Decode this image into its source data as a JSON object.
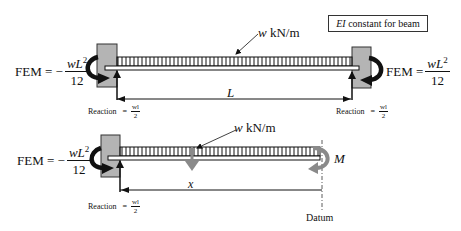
{
  "note": {
    "ei_symbol": "EI",
    "text": " constant for beam"
  },
  "top_beam": {
    "load_label_w": "w",
    "load_label_units": " kN/m",
    "span_label": "L",
    "left_fem": {
      "prefix": "FEM = −",
      "numerator_var": "wL",
      "numerator_exp": "2",
      "denominator": "12"
    },
    "right_fem": {
      "prefix": "FEM =",
      "numerator_var": "wL",
      "numerator_exp": "2",
      "denominator": "12"
    },
    "left_reaction": {
      "label": "Reaction",
      "eq": "=",
      "numerator": "wl",
      "denominator": "2"
    },
    "right_reaction": {
      "label": "Reaction",
      "eq": "=",
      "numerator": "wl",
      "denominator": "2"
    }
  },
  "bottom_beam": {
    "load_label_w": "w",
    "load_label_units": " kN/m",
    "distance_label": "x",
    "moment_label": "M",
    "datum_label": "Datum",
    "left_fem": {
      "prefix": "FEM = −",
      "numerator_var": "wL",
      "numerator_exp": "2",
      "denominator": "12"
    },
    "left_reaction": {
      "label": "Reaction",
      "eq": "=",
      "numerator": "wl",
      "denominator": "2"
    }
  },
  "colors": {
    "wall_fill": "#b4b4b4",
    "line": "#111111",
    "gray_arrow": "#8a8a8a"
  }
}
